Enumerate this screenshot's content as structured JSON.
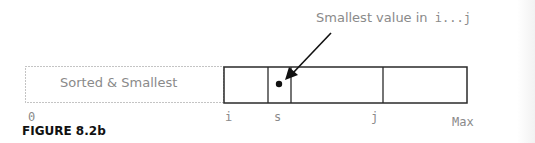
{
  "figure": {
    "caption": "FIGURE 8.2b",
    "callout": {
      "text_prefix": "Smallest value in",
      "text_range": "i...j"
    },
    "sorted_region_label": "Sorted & Smallest",
    "index_labels": {
      "start": "0",
      "i": "i",
      "s": "s",
      "j": "j",
      "end": "Max"
    },
    "colors": {
      "line": "#2a2a2a",
      "text_gray": "#8a8a8a",
      "dotted": "#888888",
      "caption": "#111111"
    }
  }
}
